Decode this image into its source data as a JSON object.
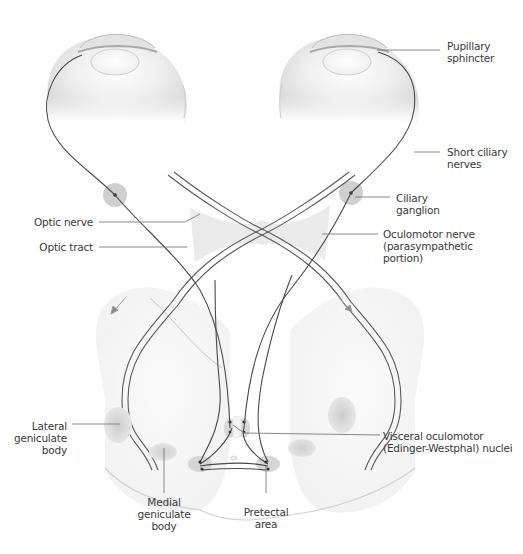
{
  "diagram": {
    "type": "anatomical-illustration",
    "colors": {
      "nerve_line": "#4a4a4a",
      "tract_outline": "#5a5a5a",
      "leader_line": "#7a7a7a",
      "ganglion_fill": "#c8c8c8",
      "nucleus_fill": "#cfcfcf",
      "label_text": "#3a3a3a",
      "background": "#ffffff"
    },
    "labels": {
      "pupillary_sphincter": [
        "Pupillary",
        "sphincter"
      ],
      "short_ciliary_nerves": [
        "Short ciliary",
        "nerves"
      ],
      "ciliary_ganglion": [
        "Ciliary",
        "ganglion"
      ],
      "oculomotor_nerve": [
        "Oculomotor nerve",
        "(parasympathetic",
        "portion)"
      ],
      "optic_nerve": [
        "Optic nerve"
      ],
      "optic_tract": [
        "Optic tract"
      ],
      "lateral_geniculate_body": [
        "Lateral",
        "geniculate",
        "body"
      ],
      "medial_geniculate_body": [
        "Medial",
        "geniculate",
        "body"
      ],
      "pretectal_area": [
        "Pretectal",
        "area"
      ],
      "visceral_oculomotor_nuclei": [
        "Visceral oculomotor",
        "(Edinger-Westphal) nuclei"
      ]
    }
  }
}
